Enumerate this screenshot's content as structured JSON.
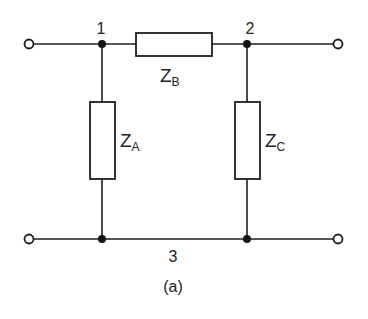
{
  "diagram": {
    "type": "two-port T-network",
    "caption": "(a)",
    "nodes": [
      {
        "id": "1",
        "label": "1"
      },
      {
        "id": "2",
        "label": "2"
      },
      {
        "id": "3",
        "label": "3"
      }
    ],
    "impedances": [
      {
        "id": "ZA",
        "main": "Z",
        "sub": "A",
        "between": [
          "1",
          "3"
        ],
        "orientation": "vertical"
      },
      {
        "id": "ZB",
        "main": "Z",
        "sub": "B",
        "between": [
          "1",
          "2"
        ],
        "orientation": "horizontal"
      },
      {
        "id": "ZC",
        "main": "Z",
        "sub": "C",
        "between": [
          "2",
          "3"
        ],
        "orientation": "vertical"
      }
    ],
    "terminals": [
      {
        "id": "top-left"
      },
      {
        "id": "top-right"
      },
      {
        "id": "bottom-left"
      },
      {
        "id": "bottom-right"
      }
    ],
    "colors": {
      "line": "#1e1e1e",
      "background": "#ffffff"
    }
  }
}
